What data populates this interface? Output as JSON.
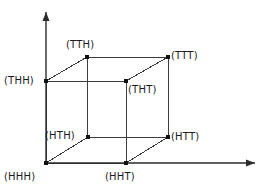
{
  "diagram": {
    "type": "3d-cube-vertex-diagram",
    "background_color": "#ffffff",
    "line_color": "#3c3c3c",
    "vertex_color": "#111111",
    "axis_color": "#2b2b2b",
    "text_color": "#1a1a1a",
    "axes": {
      "vertical": {
        "name": "vertical-axis",
        "from": [
          46,
          163
        ],
        "to": [
          46,
          12
        ],
        "arrow": "up"
      },
      "horizontal": {
        "name": "horizontal-axis",
        "from": [
          46,
          163
        ],
        "to": [
          255,
          163
        ],
        "arrow": "right"
      }
    },
    "vertices": [
      {
        "id": "HHH",
        "label": "(HHH)",
        "x": 46,
        "y": 163,
        "label_x": 4,
        "label_y": 171,
        "face": "front-bottom-left"
      },
      {
        "id": "HHT",
        "label": "(HHT)",
        "x": 126,
        "y": 163,
        "label_x": 105,
        "label_y": 171,
        "face": "front-bottom-right"
      },
      {
        "id": "THH",
        "label": "(THH)",
        "x": 46,
        "y": 81,
        "label_x": 4,
        "label_y": 75,
        "face": "front-top-left"
      },
      {
        "id": "THT",
        "label": "(THT)",
        "x": 126,
        "y": 81,
        "label_x": 128,
        "label_y": 84,
        "face": "front-top-right"
      },
      {
        "id": "HTH",
        "label": "(HTH)",
        "x": 88,
        "y": 137,
        "label_x": 45,
        "label_y": 130,
        "face": "back-bottom-left"
      },
      {
        "id": "HTT",
        "label": "(HTT)",
        "x": 168,
        "y": 137,
        "label_x": 171,
        "label_y": 131,
        "face": "back-bottom-right"
      },
      {
        "id": "TTH",
        "label": "(TTH)",
        "x": 87,
        "y": 57,
        "label_x": 66,
        "label_y": 39,
        "face": "back-top-left"
      },
      {
        "id": "TTT",
        "label": "(TTT)",
        "x": 168,
        "y": 57,
        "label_x": 171,
        "label_y": 50,
        "face": "back-top-right"
      }
    ],
    "edges": [
      {
        "name": "edge-HHH-HHT",
        "from": "HHH",
        "to": "HHT"
      },
      {
        "name": "edge-HHH-THH",
        "from": "HHH",
        "to": "THH"
      },
      {
        "name": "edge-HHT-THT",
        "from": "HHT",
        "to": "THT"
      },
      {
        "name": "edge-THH-THT",
        "from": "THH",
        "to": "THT"
      },
      {
        "name": "edge-HTH-HTT",
        "from": "HTH",
        "to": "HTT"
      },
      {
        "name": "edge-HTH-TTH",
        "from": "HTH",
        "to": "TTH"
      },
      {
        "name": "edge-HTT-TTT",
        "from": "HTT",
        "to": "TTT"
      },
      {
        "name": "edge-TTH-TTT",
        "from": "TTH",
        "to": "TTT"
      },
      {
        "name": "edge-HHH-HTH",
        "from": "HHH",
        "to": "HTH"
      },
      {
        "name": "edge-HHT-HTT",
        "from": "HHT",
        "to": "HTT"
      },
      {
        "name": "edge-THH-TTH",
        "from": "THH",
        "to": "TTH"
      },
      {
        "name": "edge-THT-TTT",
        "from": "THT",
        "to": "TTT"
      }
    ]
  }
}
